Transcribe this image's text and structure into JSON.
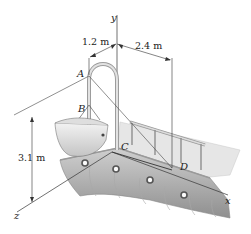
{
  "figure": {
    "axes": {
      "x": "x",
      "y": "y",
      "z": "z"
    },
    "points": {
      "A": "A",
      "B": "B",
      "C": "C",
      "D": "D"
    },
    "dimensions": {
      "d1": "1.2 m",
      "d2": "2.4 m",
      "d3": "3.1 m"
    },
    "colors": {
      "line": "#333333",
      "hull": "#b8b8b8",
      "deck": "#e4e4e4",
      "davit": "#d8d8d8"
    }
  }
}
